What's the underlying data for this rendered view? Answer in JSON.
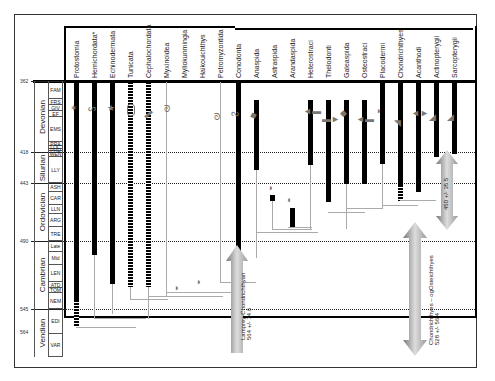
{
  "taxa": [
    {
      "name": "Protostomia",
      "x": 76
    },
    {
      "name": "Hemichordata*",
      "x": 94
    },
    {
      "name": "Echinodermata",
      "x": 112
    },
    {
      "name": "Tunicata",
      "x": 130
    },
    {
      "name": "Cephalochordata",
      "x": 148
    },
    {
      "name": "Myxinoidea",
      "x": 166
    },
    {
      "name": "Myllokunmingia",
      "x": 184
    },
    {
      "name": "Haikouichthys",
      "x": 202
    },
    {
      "name": "Petromyzontida",
      "x": 220
    },
    {
      "name": "Conodonta",
      "x": 238
    },
    {
      "name": "Anaspida",
      "x": 256
    },
    {
      "name": "Astraspida",
      "x": 274
    },
    {
      "name": "Arandaspida",
      "x": 292
    },
    {
      "name": "Heterostraci",
      "x": 310
    },
    {
      "name": "Thelodonti",
      "x": 328
    },
    {
      "name": "Galeaspida",
      "x": 346
    },
    {
      "name": "Osteostraci",
      "x": 364
    },
    {
      "name": "Placodermi",
      "x": 382
    },
    {
      "name": "Chondrichthyes",
      "x": 400
    },
    {
      "name": "Acanthodi",
      "x": 418
    },
    {
      "name": "Actinopterygii",
      "x": 436
    },
    {
      "name": "Sarcopterygii",
      "x": 454
    }
  ],
  "time_ticks": [
    {
      "label": "362",
      "y": 81
    },
    {
      "label": "418",
      "y": 152
    },
    {
      "label": "443",
      "y": 183
    },
    {
      "label": "490",
      "y": 241
    },
    {
      "label": "545",
      "y": 309
    },
    {
      "label": "564",
      "y": 332
    }
  ],
  "periods": [
    {
      "name": "Devonian",
      "top": 81,
      "height": 71
    },
    {
      "name": "Silurian",
      "top": 152,
      "height": 31
    },
    {
      "name": "Ordovician",
      "top": 183,
      "height": 58
    },
    {
      "name": "Cambrian",
      "top": 241,
      "height": 68
    },
    {
      "name": "Vendian",
      "top": 309,
      "height": 48
    }
  ],
  "stages": [
    {
      "name": "FAM",
      "top": 81,
      "height": 18
    },
    {
      "name": "FRS",
      "top": 99,
      "height": 6
    },
    {
      "name": "GIV",
      "top": 105,
      "height": 6
    },
    {
      "name": "EF",
      "top": 111,
      "height": 6
    },
    {
      "name": "EMS",
      "top": 117,
      "height": 25
    },
    {
      "name": "PRA",
      "top": 142,
      "height": 4
    },
    {
      "name": "LOC",
      "top": 146,
      "height": 3
    },
    {
      "name": "PRD",
      "top": 149,
      "height": 2
    },
    {
      "name": "WEN",
      "top": 151,
      "height": 6
    },
    {
      "name": "LLY",
      "top": 157,
      "height": 26
    },
    {
      "name": "ASH",
      "top": 183,
      "height": 9
    },
    {
      "name": "CAR",
      "top": 192,
      "height": 13
    },
    {
      "name": "LLN",
      "top": 205,
      "height": 9
    },
    {
      "name": "ARG",
      "top": 214,
      "height": 13
    },
    {
      "name": "TRE",
      "top": 227,
      "height": 14
    },
    {
      "name": "Late",
      "top": 241,
      "height": 11
    },
    {
      "name": "Mid",
      "top": 252,
      "height": 13
    },
    {
      "name": "LEN",
      "top": 265,
      "height": 17
    },
    {
      "name": "ATD",
      "top": 282,
      "height": 6
    },
    {
      "name": "TOM",
      "top": 288,
      "height": 5
    },
    {
      "name": "NEM",
      "top": 293,
      "height": 16
    },
    {
      "name": "EDI",
      "top": 309,
      "height": 25
    },
    {
      "name": "VAR",
      "top": 334,
      "height": 23
    }
  ],
  "annotations": {
    "lamprey": {
      "line1": "Lamprey-Chondrichthyan",
      "line2": "564 +/- 74.6"
    },
    "chondro": {
      "line1": "Chondrichthyes – ogOsteichthyes",
      "line2": "528 +/- 56.4"
    },
    "actino": {
      "line1": "450 +/- 35.5"
    }
  },
  "colors": {
    "bar": "#000000",
    "thin": "#aaaaaa",
    "arrow": "#999999"
  }
}
